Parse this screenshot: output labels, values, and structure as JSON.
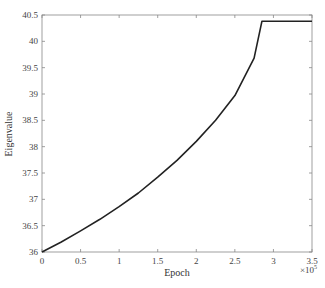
{
  "chart_data": {
    "type": "line",
    "title": "",
    "xlabel": "Epoch",
    "ylabel": "Eigenvalue",
    "x_multiplier": "×10^5",
    "x_multiplier_base": "×10",
    "x_multiplier_exp": "5",
    "xlim": [
      0,
      3.5
    ],
    "ylim": [
      36,
      40.5
    ],
    "xticks": [
      "0",
      "0.5",
      "1",
      "1.5",
      "2",
      "2.5",
      "3",
      "3.5"
    ],
    "yticks": [
      "36",
      "36.5",
      "37",
      "37.5",
      "38",
      "38.5",
      "39",
      "39.5",
      "40",
      "40.5"
    ],
    "grid": false,
    "legend": null,
    "series": [
      {
        "name": "Eigenvalue",
        "color": "#222222",
        "x": [
          0,
          0.25,
          0.5,
          0.75,
          1.0,
          1.25,
          1.5,
          1.75,
          2.0,
          2.25,
          2.5,
          2.75,
          2.85,
          3.0,
          3.25,
          3.5
        ],
        "y": [
          36.0,
          36.19,
          36.4,
          36.62,
          36.86,
          37.12,
          37.42,
          37.74,
          38.1,
          38.5,
          38.97,
          39.68,
          40.38,
          40.38,
          40.38,
          40.38
        ]
      }
    ]
  }
}
